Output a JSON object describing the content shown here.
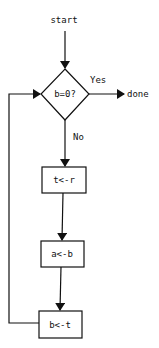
{
  "diagram": {
    "type": "flowchart",
    "nodes": {
      "start": "start",
      "decision": "b=0?",
      "done": "done",
      "step1": "t<-r",
      "step2": "a<-b",
      "step3": "b<-t"
    },
    "edges": {
      "yes_label": "Yes",
      "no_label": "No"
    },
    "colors": {
      "stroke": "#111111",
      "background": "#ffffff"
    }
  }
}
